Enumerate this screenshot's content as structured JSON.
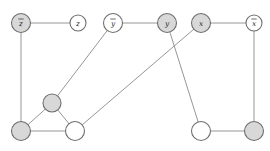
{
  "figure": {
    "width": 270,
    "height": 151,
    "background_color": "#ffffff",
    "top_clipped_text": "",
    "styles": {
      "edge_color": "#8a8a8a",
      "node_stroke_color": "#6e6e6e",
      "node_fill_shaded": "#d8d8d8",
      "node_fill_empty": "#ffffff",
      "label_color": "#1c1c1c"
    }
  },
  "chart_data": {
    "type": "diagram",
    "subtype": "node-link-graph",
    "node_count": 11,
    "edge_count": 12,
    "legend": [
      {
        "swatch": "#d8d8d8",
        "meaning": "shaded vertex"
      },
      {
        "swatch": "#ffffff",
        "meaning": "unshaded vertex"
      }
    ],
    "nodes": [
      {
        "id": "n0",
        "label": "z",
        "overline": true,
        "x": 21,
        "y": 23,
        "r": 9.5,
        "fill": "#d8d8d8",
        "shaded": true,
        "labeled": true
      },
      {
        "id": "n1",
        "label": "z",
        "overline": false,
        "x": 78,
        "y": 23,
        "r": 8.0,
        "fill": "#ffffff",
        "shaded": false,
        "labeled": true
      },
      {
        "id": "n2",
        "label": "y",
        "overline": true,
        "x": 113,
        "y": 23,
        "r": 9.5,
        "fill": "#ffffff",
        "shaded": false,
        "labeled": true
      },
      {
        "id": "n3",
        "label": "y",
        "overline": false,
        "x": 167,
        "y": 23,
        "r": 9.5,
        "fill": "#d8d8d8",
        "shaded": true,
        "labeled": true
      },
      {
        "id": "n4",
        "label": "x",
        "overline": false,
        "x": 201,
        "y": 23,
        "r": 9.5,
        "fill": "#d8d8d8",
        "shaded": true,
        "labeled": true
      },
      {
        "id": "n5",
        "label": "x",
        "overline": true,
        "x": 254,
        "y": 23,
        "r": 8.0,
        "fill": "#ffffff",
        "shaded": false,
        "labeled": true
      },
      {
        "id": "n6",
        "label": "",
        "overline": false,
        "x": 52,
        "y": 103,
        "r": 9.0,
        "fill": "#d8d8d8",
        "shaded": true,
        "labeled": false
      },
      {
        "id": "n7",
        "label": "",
        "overline": false,
        "x": 21,
        "y": 131,
        "r": 9.5,
        "fill": "#d8d8d8",
        "shaded": true,
        "labeled": false
      },
      {
        "id": "n8",
        "label": "",
        "overline": false,
        "x": 75,
        "y": 131,
        "r": 9.5,
        "fill": "#ffffff",
        "shaded": false,
        "labeled": false
      },
      {
        "id": "n9",
        "label": "",
        "overline": false,
        "x": 201,
        "y": 131,
        "r": 9.5,
        "fill": "#ffffff",
        "shaded": false,
        "labeled": false
      },
      {
        "id": "n10",
        "label": "",
        "overline": false,
        "x": 254,
        "y": 131,
        "r": 9.5,
        "fill": "#d8d8d8",
        "shaded": true,
        "labeled": false
      }
    ],
    "edges": [
      {
        "from": "n0",
        "to": "n1"
      },
      {
        "from": "n2",
        "to": "n3"
      },
      {
        "from": "n4",
        "to": "n5"
      },
      {
        "from": "n0",
        "to": "n7"
      },
      {
        "from": "n5",
        "to": "n10"
      },
      {
        "from": "n2",
        "to": "n6"
      },
      {
        "from": "n3",
        "to": "n9"
      },
      {
        "from": "n4",
        "to": "n8"
      },
      {
        "from": "n6",
        "to": "n7"
      },
      {
        "from": "n6",
        "to": "n8"
      },
      {
        "from": "n7",
        "to": "n8"
      },
      {
        "from": "n9",
        "to": "n10"
      }
    ]
  }
}
